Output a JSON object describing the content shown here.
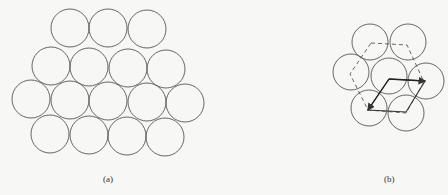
{
  "figure": {
    "panel_a": {
      "label": "(a)",
      "description": "Close-packed layer of equal circles (hexagonal arrangement), 16 circles in 4 rows",
      "circle_radius": 19,
      "circles": [
        [
          70,
          28
        ],
        [
          108,
          28
        ],
        [
          147,
          29
        ],
        [
          51,
          66
        ],
        [
          89,
          67
        ],
        [
          128,
          68
        ],
        [
          166,
          69
        ],
        [
          31,
          99
        ],
        [
          70,
          100
        ],
        [
          108,
          101
        ],
        [
          147,
          102
        ],
        [
          185,
          103
        ],
        [
          50,
          134
        ],
        [
          89,
          135
        ],
        [
          127,
          136
        ],
        [
          165,
          137
        ]
      ]
    },
    "panel_b": {
      "label": "(b)",
      "description": "Seven circles in hexagonal cluster with dashed hexagon and solid rhombus unit cell with two arrow vectors",
      "circle_radius": 18,
      "circles": [
        [
          370,
          42
        ],
        [
          408,
          42
        ],
        [
          351,
          72
        ],
        [
          389,
          76
        ],
        [
          426,
          81
        ],
        [
          369,
          108
        ],
        [
          406,
          113
        ]
      ],
      "dashed_hexagon": [
        [
          371,
          43
        ],
        [
          407,
          45
        ],
        [
          424,
          82
        ],
        [
          406,
          113
        ],
        [
          368,
          110
        ],
        [
          350,
          74
        ]
      ],
      "rhombus": [
        [
          389,
          79
        ],
        [
          425,
          81
        ],
        [
          406,
          112
        ],
        [
          368,
          110
        ]
      ],
      "arrows": [
        {
          "from": [
            389,
            79
          ],
          "to": [
            425,
            81
          ]
        },
        {
          "from": [
            389,
            79
          ],
          "to": [
            368,
            110
          ]
        }
      ]
    },
    "colors": {
      "stroke": "#555555",
      "background": "#f7f7f5"
    }
  }
}
